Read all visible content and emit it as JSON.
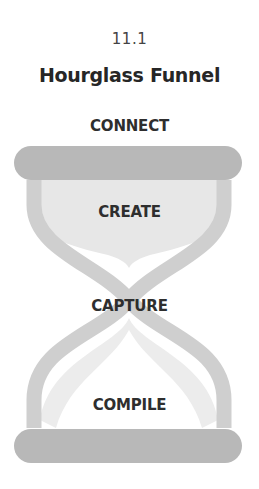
{
  "figure": {
    "number": "11.1",
    "title": "Hourglass Funnel"
  },
  "stages": [
    {
      "label": "CONNECT",
      "position": "top-bar"
    },
    {
      "label": "CREATE",
      "position": "upper-bulb"
    },
    {
      "label": "CAPTURE",
      "position": "neck"
    },
    {
      "label": "COMPILE",
      "position": "lower-bulb"
    }
  ],
  "colors": {
    "bar": "#b8b8b8",
    "frame": "#cfcfcf",
    "fill_light": "#e6e6e6",
    "text": "#2b2b2b"
  }
}
